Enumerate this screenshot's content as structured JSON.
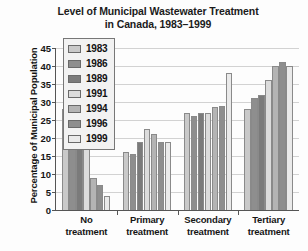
{
  "chart_data": {
    "type": "bar",
    "title": "Level of Municipal Wastewater Treatment in Canada, 1983–1999",
    "title_line1": "Level of Municipal Wastewater Treatment",
    "title_line2": "in Canada, 1983–1999",
    "xlabel": "",
    "ylabel": "Percentage of Municipal Population",
    "ylim": [
      0,
      45
    ],
    "yticks": [
      0,
      5,
      10,
      15,
      20,
      25,
      30,
      35,
      40,
      45
    ],
    "ytick_labels": [
      "0",
      "5",
      "10",
      "15",
      "20",
      "25",
      "30",
      "35",
      "40",
      "45"
    ],
    "grid": true,
    "legend_position": "upper-left-inset",
    "categories": [
      "No treatment",
      "Primary treatment",
      "Secondary treatment",
      "Tertiary treatment"
    ],
    "category_lines": [
      [
        "No",
        "treatment"
      ],
      [
        "Primary",
        "treatment"
      ],
      [
        "Secondary",
        "treatment"
      ],
      [
        "Tertiary",
        "treatment"
      ]
    ],
    "series": [
      {
        "name": "1983",
        "color": "#c9c9c9",
        "values": [
          28,
          16,
          27,
          28
        ]
      },
      {
        "name": "1986",
        "color": "#8e8e8e",
        "values": [
          28,
          15.5,
          26,
          31
        ]
      },
      {
        "name": "1989",
        "color": "#7b7b7b",
        "values": [
          24,
          19,
          27,
          32
        ]
      },
      {
        "name": "1991",
        "color": "#dcdcdc",
        "values": [
          19,
          22.5,
          27,
          36
        ]
      },
      {
        "name": "1994",
        "color": "#b4b4b4",
        "values": [
          9,
          21,
          28.5,
          40
        ]
      },
      {
        "name": "1996",
        "color": "#8e8e8e",
        "values": [
          7,
          19,
          29,
          41
        ]
      },
      {
        "name": "1999",
        "color": "#eaeaea",
        "values": [
          4,
          19,
          38,
          40
        ]
      }
    ]
  },
  "legend": {
    "items": [
      {
        "label": "1983"
      },
      {
        "label": "1986"
      },
      {
        "label": "1989"
      },
      {
        "label": "1991"
      },
      {
        "label": "1994"
      },
      {
        "label": "1996"
      },
      {
        "label": "1999"
      }
    ]
  }
}
